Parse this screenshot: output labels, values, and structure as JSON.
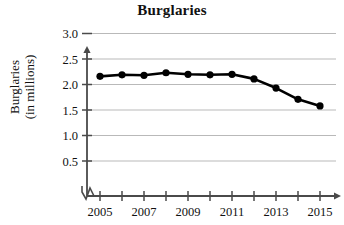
{
  "chart_data": {
    "type": "line",
    "title": "Burglaries",
    "xlabel": "",
    "ylabel": "Burglaries (in millions)",
    "ylabel_line1": "Burglaries",
    "ylabel_line2": "(in millions)",
    "x": [
      2005,
      2006,
      2007,
      2008,
      2009,
      2010,
      2011,
      2012,
      2013,
      2014,
      2015
    ],
    "values": [
      2.16,
      2.19,
      2.18,
      2.23,
      2.2,
      2.19,
      2.2,
      2.11,
      1.93,
      1.71,
      1.58
    ],
    "xtick_labels": [
      "2005",
      "2007",
      "2009",
      "2011",
      "2013",
      "2015"
    ],
    "xtick_label_values": [
      2005,
      2007,
      2009,
      2011,
      2013,
      2015
    ],
    "ytick_labels": [
      "3.0",
      "2.5",
      "2.0",
      "1.5",
      "1.0",
      "0.5"
    ],
    "ytick_values": [
      3.0,
      2.5,
      2.0,
      1.5,
      1.0,
      0.5
    ],
    "xlim": [
      2004.5,
      2015.8
    ],
    "ylim": [
      0.0,
      3.25
    ],
    "grid": true,
    "grid_axis": "y",
    "legend": false,
    "axis_break": true,
    "marker": "filled-circle",
    "line_color": "#000000",
    "marker_color": "#000000",
    "grid_color": "#b9b9b9",
    "axis_color": "#4a4a4a",
    "background_color": "#ffffff"
  }
}
